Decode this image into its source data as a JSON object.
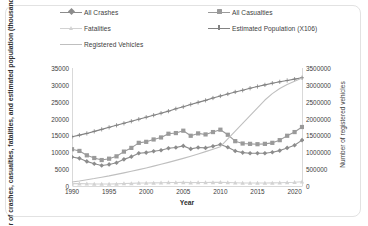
{
  "chart_data": {
    "type": "line",
    "title": "",
    "xlabel": "Year",
    "ylabel": "Number of crashes, casualties, fatalities, and estimated population (thousand)",
    "ylabel_secondary": "Number of registered vehicles",
    "xlim": [
      1990,
      2021
    ],
    "ylim": [
      0,
      35000
    ],
    "ylim_secondary": [
      0,
      3500000
    ],
    "xticks": [
      1990,
      1995,
      2000,
      2005,
      2010,
      2015,
      2020
    ],
    "yticks": [
      0,
      5000,
      10000,
      15000,
      20000,
      25000,
      30000,
      35000
    ],
    "yticks_secondary": [
      0,
      500000,
      1000000,
      1500000,
      2000000,
      2500000,
      3000000,
      3500000
    ],
    "grid": false,
    "legend_position": "top",
    "x": [
      1990,
      1991,
      1992,
      1993,
      1994,
      1995,
      1996,
      1997,
      1998,
      1999,
      2000,
      2001,
      2002,
      2003,
      2004,
      2005,
      2006,
      2007,
      2008,
      2009,
      2010,
      2011,
      2012,
      2013,
      2014,
      2015,
      2016,
      2017,
      2018,
      2019,
      2020,
      2021
    ],
    "series": [
      {
        "name": "All Crashes",
        "axis": "left",
        "color": "#8c8c8c",
        "marker": "diamond",
        "values": [
          8600,
          8200,
          7300,
          6600,
          6100,
          6400,
          6900,
          7900,
          8700,
          9700,
          9900,
          10300,
          10600,
          11200,
          11400,
          11900,
          11000,
          11400,
          11300,
          11800,
          12300,
          11500,
          10400,
          9900,
          9700,
          9700,
          9700,
          10000,
          10500,
          11300,
          12100,
          13600
        ]
      },
      {
        "name": "All Casualties",
        "axis": "left",
        "color": "#9a9a9a",
        "marker": "square",
        "values": [
          10900,
          10400,
          9100,
          8300,
          7700,
          8100,
          8800,
          10200,
          11300,
          12800,
          13100,
          13800,
          14400,
          15500,
          15700,
          16400,
          14900,
          15600,
          15300,
          16000,
          16700,
          15200,
          13300,
          12600,
          12500,
          12400,
          12500,
          12800,
          13600,
          14900,
          16000,
          17500
        ]
      },
      {
        "name": "Fatalities",
        "axis": "left",
        "color": "#d2d2d2",
        "marker": "triangle",
        "values": [
          700,
          700,
          650,
          600,
          580,
          600,
          640,
          720,
          790,
          880,
          900,
          940,
          970,
          1020,
          1040,
          1090,
          1010,
          1050,
          1040,
          1090,
          1130,
          1060,
          960,
          910,
          900,
          900,
          900,
          930,
          980,
          1050,
          1120,
          1260
        ]
      },
      {
        "name": "Estimated Population (X106)",
        "axis": "left",
        "color": "#828282",
        "marker": "cross",
        "values": [
          14600,
          15100,
          15600,
          16200,
          16800,
          17400,
          18000,
          18600,
          19200,
          19800,
          20400,
          21000,
          21600,
          22200,
          22900,
          23500,
          24200,
          24800,
          25400,
          26100,
          26700,
          27300,
          27900,
          28400,
          29000,
          29500,
          30000,
          30500,
          30900,
          31300,
          31700,
          32100
        ]
      },
      {
        "name": "Registered Vehicles",
        "axis": "right",
        "color": "#bfbfbf",
        "marker": "none",
        "values": [
          120000,
          150000,
          185000,
          220000,
          260000,
          300000,
          345000,
          390000,
          435000,
          485000,
          535000,
          590000,
          645000,
          700000,
          760000,
          820000,
          885000,
          950000,
          1020000,
          1090000,
          1165000,
          1400000,
          1630000,
          1860000,
          2090000,
          2320000,
          2550000,
          2740000,
          2890000,
          3010000,
          3110000,
          3200000
        ]
      }
    ]
  },
  "legend": {
    "items": [
      {
        "label": "All Crashes"
      },
      {
        "label": "All Casualties"
      },
      {
        "label": "Fatalities"
      },
      {
        "label": "Estimated Population (X106)"
      },
      {
        "label": "Registered Vehicles"
      }
    ]
  }
}
